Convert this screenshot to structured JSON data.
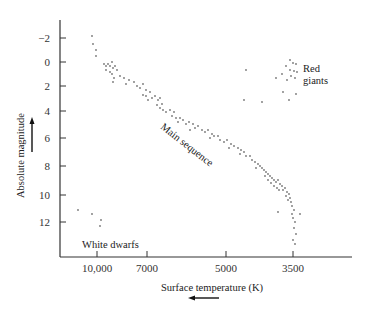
{
  "chart_data": {
    "type": "scatter",
    "title": "",
    "xlabel": "Surface temperature (K)",
    "ylabel": "Absolute magnitude",
    "x_direction_arrow": "left",
    "y_direction_arrow": "up",
    "x_ticks": [
      {
        "label": "10,000",
        "value": 10000,
        "px": 97
      },
      {
        "label": "7000",
        "value": 7000,
        "px": 147
      },
      {
        "label": "5000",
        "value": 5000,
        "px": 226
      },
      {
        "label": "3500",
        "value": 3500,
        "px": 293
      }
    ],
    "y_ticks": [
      {
        "label": "−2",
        "value": -2,
        "px": 38
      },
      {
        "label": "0",
        "value": 0,
        "px": 62
      },
      {
        "label": "2",
        "value": 2,
        "px": 86
      },
      {
        "label": "4",
        "value": 4,
        "px": 111
      },
      {
        "label": "6",
        "value": 6,
        "px": 138
      },
      {
        "label": "8",
        "value": 8,
        "px": 166
      },
      {
        "label": "10",
        "value": 10,
        "px": 195
      },
      {
        "label": "12",
        "value": 12,
        "px": 222
      }
    ],
    "ylim": [
      -3,
      14
    ],
    "y_inverted": true,
    "grid": false,
    "annotations": [
      {
        "text": "Main sequence",
        "x": 160,
        "y": 128,
        "rotate": 38
      },
      {
        "text": "Red",
        "x": 303,
        "y": 72
      },
      {
        "text": "giants",
        "x": 303,
        "y": 84
      },
      {
        "text": "White dwarfs",
        "x": 82,
        "y": 248
      }
    ],
    "series": [
      {
        "name": "Main sequence",
        "points_px": [
          [
            92,
            36
          ],
          [
            93,
            44
          ],
          [
            96,
            50
          ],
          [
            96,
            56
          ],
          [
            104,
            64
          ],
          [
            106,
            66
          ],
          [
            108,
            64
          ],
          [
            110,
            66
          ],
          [
            112,
            62
          ],
          [
            113,
            68
          ],
          [
            115,
            66
          ],
          [
            106,
            70
          ],
          [
            110,
            72
          ],
          [
            112,
            74
          ],
          [
            117,
            70
          ],
          [
            114,
            78
          ],
          [
            120,
            76
          ],
          [
            124,
            78
          ],
          [
            129,
            80
          ],
          [
            126,
            84
          ],
          [
            113,
            82
          ],
          [
            134,
            82
          ],
          [
            137,
            86
          ],
          [
            140,
            88
          ],
          [
            143,
            84
          ],
          [
            146,
            90
          ],
          [
            150,
            92
          ],
          [
            146,
            96
          ],
          [
            152,
            98
          ],
          [
            155,
            96
          ],
          [
            158,
            100
          ],
          [
            160,
            98
          ],
          [
            162,
            104
          ],
          [
            157,
            105
          ],
          [
            160,
            108
          ],
          [
            163,
            110
          ],
          [
            148,
            100
          ],
          [
            143,
            95
          ],
          [
            166,
            112
          ],
          [
            170,
            110
          ],
          [
            174,
            112
          ],
          [
            172,
            116
          ],
          [
            176,
            118
          ],
          [
            180,
            118
          ],
          [
            178,
            122
          ],
          [
            183,
            120
          ],
          [
            186,
            124
          ],
          [
            189,
            122
          ],
          [
            193,
            124
          ],
          [
            195,
            128
          ],
          [
            190,
            130
          ],
          [
            198,
            126
          ],
          [
            202,
            130
          ],
          [
            205,
            132
          ],
          [
            208,
            130
          ],
          [
            212,
            134
          ],
          [
            214,
            136
          ],
          [
            210,
            138
          ],
          [
            218,
            136
          ],
          [
            220,
            140
          ],
          [
            224,
            142
          ],
          [
            227,
            140
          ],
          [
            231,
            144
          ],
          [
            229,
            148
          ],
          [
            234,
            146
          ],
          [
            238,
            148
          ],
          [
            241,
            150
          ],
          [
            244,
            152
          ],
          [
            240,
            154
          ],
          [
            246,
            156
          ],
          [
            250,
            156
          ],
          [
            252,
            160
          ],
          [
            255,
            162
          ],
          [
            258,
            164
          ],
          [
            260,
            166
          ],
          [
            256,
            168
          ],
          [
            262,
            168
          ],
          [
            264,
            170
          ],
          [
            266,
            172
          ],
          [
            268,
            174
          ],
          [
            270,
            176
          ],
          [
            272,
            178
          ],
          [
            274,
            180
          ],
          [
            276,
            182
          ],
          [
            278,
            180
          ],
          [
            280,
            184
          ],
          [
            282,
            186
          ],
          [
            265,
            176
          ],
          [
            268,
            180
          ],
          [
            271,
            183
          ],
          [
            274,
            186
          ],
          [
            277,
            188
          ],
          [
            279,
            190
          ],
          [
            283,
            190
          ],
          [
            285,
            188
          ],
          [
            287,
            192
          ],
          [
            289,
            194
          ],
          [
            286,
            196
          ],
          [
            290,
            198
          ],
          [
            291,
            202
          ],
          [
            292,
            206
          ],
          [
            294,
            210
          ],
          [
            292,
            214
          ],
          [
            293,
            218
          ],
          [
            295,
            222
          ],
          [
            294,
            228
          ],
          [
            296,
            234
          ],
          [
            293,
            240
          ],
          [
            295,
            244
          ],
          [
            278,
            212
          ],
          [
            300,
            214
          ],
          [
            288,
            200
          ]
        ]
      },
      {
        "name": "Red giants",
        "points_px": [
          [
            290,
            60
          ],
          [
            293,
            63
          ],
          [
            296,
            64
          ],
          [
            286,
            66
          ],
          [
            290,
            70
          ],
          [
            294,
            71
          ],
          [
            297,
            72
          ],
          [
            291,
            76
          ],
          [
            295,
            78
          ],
          [
            287,
            80
          ],
          [
            276,
            78
          ],
          [
            282,
            74
          ],
          [
            283,
            92
          ],
          [
            289,
            100
          ],
          [
            296,
            94
          ],
          [
            262,
            102
          ],
          [
            246,
            70
          ],
          [
            244,
            100
          ]
        ]
      },
      {
        "name": "White dwarfs",
        "points_px": [
          [
            78,
            210
          ],
          [
            92,
            214
          ],
          [
            101,
            220
          ],
          [
            100,
            226
          ]
        ]
      }
    ]
  }
}
